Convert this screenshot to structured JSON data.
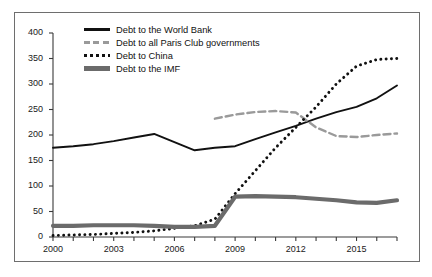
{
  "chart_data": {
    "type": "line",
    "title": "",
    "xlabel": "",
    "ylabel": "",
    "xlim": [
      2000,
      2017
    ],
    "ylim": [
      0,
      400
    ],
    "yticks": [
      0,
      50,
      100,
      150,
      200,
      250,
      300,
      350,
      400
    ],
    "xticks": [
      2000,
      2001,
      2002,
      2003,
      2004,
      2005,
      2006,
      2007,
      2008,
      2009,
      2010,
      2011,
      2012,
      2013,
      2014,
      2015,
      2016,
      2017
    ],
    "xtick_labels": [
      "2000",
      "",
      "",
      "2003",
      "",
      "",
      "2006",
      "",
      "",
      "2009",
      "",
      "",
      "2012",
      "",
      "",
      "2015",
      "",
      ""
    ],
    "grid": false,
    "legend_position": "top-left-inside",
    "x": [
      2000,
      2001,
      2002,
      2003,
      2004,
      2005,
      2006,
      2007,
      2008,
      2009,
      2010,
      2011,
      2012,
      2013,
      2014,
      2015,
      2016,
      2017
    ],
    "series": [
      {
        "name": "Debt to the World Bank",
        "style": "solid",
        "color": "#111111",
        "values": [
          175,
          178,
          182,
          188,
          195,
          202,
          186,
          170,
          175,
          178,
          192,
          205,
          218,
          232,
          245,
          255,
          272,
          297
        ]
      },
      {
        "name": "Debt to all Paris Club governments",
        "style": "dashed",
        "color": "#9a9a9a",
        "values": [
          null,
          null,
          null,
          null,
          null,
          null,
          null,
          null,
          232,
          240,
          245,
          247,
          244,
          215,
          198,
          196,
          200,
          203
        ]
      },
      {
        "name": "Debt to China",
        "style": "dotted",
        "color": "#111111",
        "values": [
          3,
          4,
          5,
          7,
          9,
          12,
          17,
          22,
          35,
          85,
          130,
          175,
          215,
          255,
          300,
          335,
          348,
          350
        ]
      },
      {
        "name": "Debt to the IMF",
        "style": "thick-solid",
        "color": "#6b6b6b",
        "values": [
          22,
          22,
          23,
          23,
          23,
          22,
          20,
          20,
          22,
          79,
          80,
          79,
          78,
          75,
          72,
          68,
          67,
          72
        ]
      }
    ]
  },
  "legend": {
    "items": [
      {
        "label": "Debt to the World Bank",
        "key": "solid-line-key"
      },
      {
        "label": "Debt to all Paris Club governments",
        "key": "dashed-line-key"
      },
      {
        "label": "Debt to China",
        "key": "dotted-line-key"
      },
      {
        "label": "Debt to the IMF",
        "key": "thick-line-key"
      }
    ]
  }
}
